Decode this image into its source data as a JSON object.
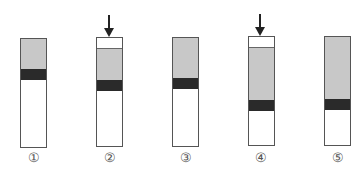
{
  "diagram": {
    "colors": {
      "outline": "#555555",
      "grey_layer": "#c8c8c8",
      "dark_band": "#2a2a2a",
      "empty": "#ffffff",
      "arrow": "#222222"
    },
    "tubes": [
      {
        "label": "①",
        "x": 20,
        "top": 38,
        "bottom": 148,
        "arrow": false,
        "layers": [
          {
            "type": "grey",
            "from": 38,
            "to": 69
          },
          {
            "type": "dark",
            "from": 69,
            "to": 80
          },
          {
            "type": "white",
            "from": 80,
            "to": 148
          }
        ]
      },
      {
        "label": "②",
        "x": 96,
        "top": 37,
        "bottom": 147,
        "arrow": true,
        "layers": [
          {
            "type": "white-cap",
            "from": 37,
            "to": 48
          },
          {
            "type": "grey",
            "from": 48,
            "to": 79
          },
          {
            "type": "dark",
            "from": 79,
            "to": 90
          },
          {
            "type": "white",
            "from": 90,
            "to": 147
          }
        ]
      },
      {
        "label": "③",
        "x": 172,
        "top": 37,
        "bottom": 147,
        "arrow": false,
        "layers": [
          {
            "type": "grey",
            "from": 37,
            "to": 78
          },
          {
            "type": "dark",
            "from": 78,
            "to": 89
          },
          {
            "type": "white",
            "from": 89,
            "to": 147
          }
        ]
      },
      {
        "label": "④",
        "x": 248,
        "top": 36,
        "bottom": 146,
        "arrow": true,
        "layers": [
          {
            "type": "white-cap",
            "from": 36,
            "to": 47
          },
          {
            "type": "grey",
            "from": 47,
            "to": 99
          },
          {
            "type": "dark",
            "from": 99,
            "to": 110
          },
          {
            "type": "white",
            "from": 110,
            "to": 146
          }
        ]
      },
      {
        "label": "⑤",
        "x": 324,
        "top": 36,
        "bottom": 146,
        "arrow": false,
        "layers": [
          {
            "type": "grey",
            "from": 36,
            "to": 98
          },
          {
            "type": "dark",
            "from": 98,
            "to": 109
          },
          {
            "type": "white",
            "from": 109,
            "to": 146
          }
        ]
      }
    ]
  },
  "labels": {
    "t1": "①",
    "t2": "②",
    "t3": "③",
    "t4": "④",
    "t5": "⑤"
  }
}
